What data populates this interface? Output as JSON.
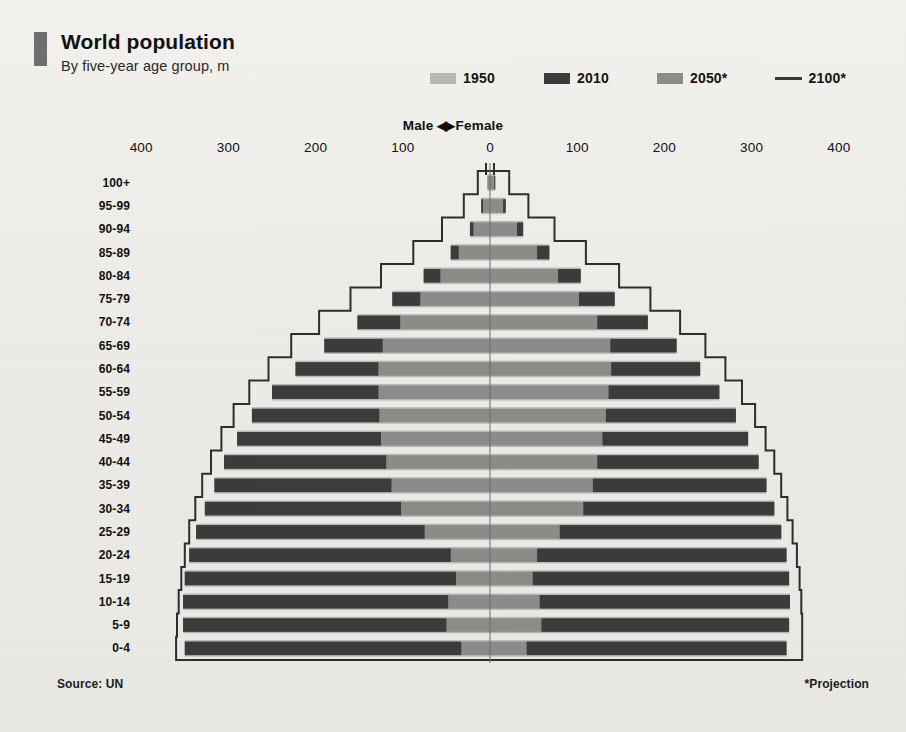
{
  "header": {
    "title": "World population",
    "subtitle": "By five-year age group, m",
    "source": "Source: UN",
    "projection_note": "*Projection",
    "mid_label_male": "Male",
    "mid_label_arrows": "◀▶",
    "mid_label_female": "Female"
  },
  "colors": {
    "c1950": "#b9b9b7",
    "c2010": "#3c3c3c",
    "c2050": "#8c8c8a",
    "c2100": "#2e2e2e",
    "background": "#efeeeb",
    "text": "#141414",
    "accent_mark": "#6f6f6f"
  },
  "legend": {
    "items": [
      {
        "label": "1950",
        "type": "swatch",
        "color": "#b9b9b7"
      },
      {
        "label": "2010",
        "type": "swatch",
        "color": "#3c3c3c"
      },
      {
        "label": "2050*",
        "type": "swatch",
        "color": "#8c8c8a"
      },
      {
        "label": "2100*",
        "type": "line",
        "color": "#3a3a3a"
      }
    ]
  },
  "axis": {
    "tick_labels": [
      "400",
      "300",
      "200",
      "100",
      "0",
      "100",
      "200",
      "300",
      "400"
    ],
    "tick_values": [
      -400,
      -300,
      -200,
      -100,
      0,
      100,
      200,
      300,
      400
    ],
    "xlim": [
      -430,
      430
    ],
    "units": "millions"
  },
  "chart_data": {
    "type": "bar",
    "subtype": "population-pyramid",
    "title": "World population",
    "subtitle": "By five-year age group, m",
    "xlabel": "Population, m",
    "ylabel": "Five-year age group",
    "xlim": [
      -430,
      430
    ],
    "grid": false,
    "legend_position": "top-right",
    "left_side": "Male",
    "right_side": "Female",
    "categories": [
      "100+",
      "95-99",
      "90-94",
      "85-89",
      "80-84",
      "75-79",
      "70-74",
      "65-69",
      "60-64",
      "55-59",
      "50-54",
      "45-49",
      "40-44",
      "35-39",
      "30-34",
      "25-29",
      "20-24",
      "15-19",
      "10-14",
      "5-9",
      "0-4"
    ],
    "series": [
      {
        "name": "1950",
        "color": "#b9b9b7",
        "male": [
          0,
          0,
          1,
          2,
          5,
          9,
          16,
          24,
          34,
          44,
          55,
          66,
          80,
          95,
          112,
          130,
          148,
          163,
          176,
          185,
          196
        ],
        "female": [
          0,
          0,
          1,
          2,
          6,
          10,
          17,
          25,
          35,
          46,
          57,
          68,
          82,
          97,
          113,
          131,
          149,
          163,
          175,
          183,
          193
        ]
      },
      {
        "name": "2010",
        "color": "#3c3c3c",
        "male": [
          0,
          2,
          4,
          9,
          19,
          32,
          49,
          67,
          95,
          122,
          146,
          165,
          186,
          203,
          225,
          262,
          300,
          311,
          304,
          302,
          317
        ],
        "female": [
          1,
          3,
          7,
          14,
          26,
          41,
          58,
          76,
          102,
          127,
          149,
          167,
          185,
          199,
          219,
          254,
          286,
          294,
          287,
          284,
          298
        ]
      },
      {
        "name": "2050*",
        "color": "#8c8c8a",
        "male": [
          3,
          10,
          23,
          45,
          76,
          112,
          152,
          190,
          223,
          250,
          273,
          290,
          305,
          316,
          327,
          337,
          345,
          350,
          352,
          352,
          350
        ],
        "female": [
          6,
          18,
          38,
          68,
          104,
          143,
          181,
          214,
          241,
          263,
          282,
          296,
          308,
          317,
          326,
          334,
          340,
          343,
          344,
          343,
          340
        ]
      },
      {
        "name": "2100*",
        "color": "#2e2e2e",
        "style": "outline-step",
        "male": [
          14,
          30,
          55,
          88,
          125,
          160,
          196,
          228,
          254,
          276,
          294,
          308,
          320,
          330,
          338,
          345,
          350,
          354,
          357,
          359,
          360
        ],
        "female": [
          22,
          44,
          74,
          110,
          148,
          184,
          218,
          247,
          270,
          289,
          304,
          316,
          326,
          334,
          341,
          347,
          352,
          355,
          357,
          358,
          358
        ]
      }
    ]
  },
  "age_labels": [
    "100+",
    "95-99",
    "90-94",
    "85-89",
    "80-84",
    "75-79",
    "70-74",
    "65-69",
    "60-64",
    "55-59",
    "50-54",
    "45-49",
    "40-44",
    "35-39",
    "30-34",
    "25-29",
    "20-24",
    "15-19",
    "10-14",
    "5-9",
    "0-4"
  ]
}
